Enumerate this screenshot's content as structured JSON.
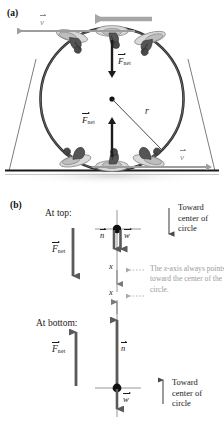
{
  "figure": {
    "panels": [
      {
        "id": "a",
        "letter": "(a)"
      },
      {
        "id": "b",
        "letter": "(b)"
      }
    ]
  },
  "panel_a": {
    "letter": "(a)",
    "description": "Motorcycle riders in a spherical cage (globe of death) traveling in a vertical circle",
    "labels": {
      "velocity_top": "v",
      "velocity_bottom": "v",
      "force_top": "F",
      "force_top_sub": "net",
      "force_bottom": "F",
      "force_bottom_sub": "net",
      "radius": "r"
    },
    "riders": {
      "top_count": 3,
      "bottom_count": 3
    },
    "colors": {
      "circle": "#2b2b2b",
      "velocity_arrow": "#9e9e9e",
      "force_arrow": "#1a1a1a",
      "ground": "#1a1a1a",
      "strut": "#6e6e6e"
    }
  },
  "panel_b": {
    "letter": "(b)",
    "at_top": {
      "heading": "At top:",
      "force_label": "F",
      "force_sub": "net",
      "normal_label": "n",
      "weight_label": "w",
      "axis_label": "x",
      "toward_line1": "Toward",
      "toward_line2": "center of",
      "toward_line3": "circle",
      "arrow_direction": "down"
    },
    "at_bottom": {
      "heading": "At bottom:",
      "force_label": "F",
      "force_sub": "net",
      "normal_label": "n",
      "weight_label": "w",
      "axis_label": "x",
      "toward_line1": "Toward",
      "toward_line2": "center of",
      "toward_line3": "circle",
      "arrow_direction": "up"
    },
    "annotation": {
      "line1_pre": "The ",
      "line1_italic": "x",
      "line1_post": "-axis always",
      "line2": "points toward the",
      "line3": "center of the circle."
    },
    "colors": {
      "vector": "#5a5a5a",
      "axis": "#7a7a7a",
      "particle": "#101010",
      "annotation": "#9a9a9a"
    }
  }
}
